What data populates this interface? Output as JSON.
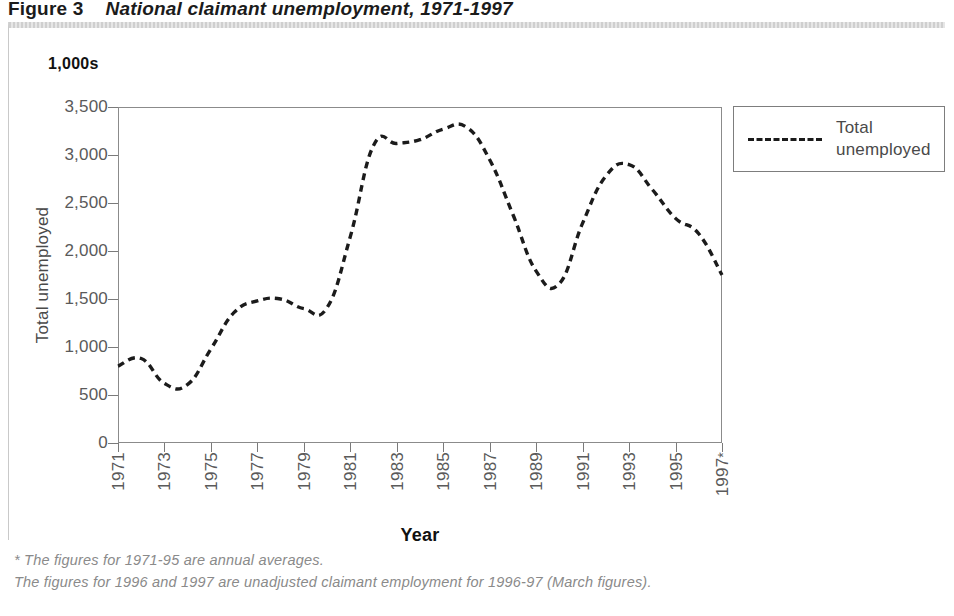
{
  "title": {
    "figure_number": "Figure 3",
    "text": "National claimant unemployment, 1971-1997"
  },
  "legend": {
    "entries": [
      {
        "label": "Total unemployed",
        "style": "dashed",
        "color": "#1b1b1b"
      }
    ]
  },
  "footnotes": [
    "* The figures for 1971-95 are annual averages.",
    "The figures for 1996 and 1997 are unadjusted claimant employment for 1996-97 (March figures)."
  ],
  "chart_data": {
    "type": "line",
    "title": "National claimant unemployment, 1971-1997",
    "unit_label": "1,000s",
    "xlabel": "Year",
    "ylabel": "Total unemployed",
    "xlim": [
      1971,
      1997
    ],
    "ylim": [
      0,
      3500
    ],
    "ytick_step": 500,
    "grid": false,
    "legend_position": "right",
    "ytick_labels": [
      "3,500",
      "3,000",
      "2,500",
      "2,000",
      "1,500",
      "1,000",
      "500",
      "0"
    ],
    "ytick_values": [
      3500,
      3000,
      2500,
      2000,
      1500,
      1000,
      500,
      0
    ],
    "xtick_labels": [
      "1971",
      "1973",
      "1975",
      "1977",
      "1979",
      "1981",
      "1983",
      "1985",
      "1987",
      "1989",
      "1991",
      "1993",
      "1995",
      "1997*"
    ],
    "xtick_values": [
      1971,
      1973,
      1975,
      1977,
      1979,
      1981,
      1983,
      1985,
      1987,
      1989,
      1991,
      1993,
      1995,
      1997
    ],
    "x": [
      1971,
      1972,
      1973,
      1974,
      1975,
      1976,
      1977,
      1978,
      1979,
      1980,
      1981,
      1982,
      1983,
      1984,
      1985,
      1986,
      1987,
      1988,
      1989,
      1990,
      1991,
      1992,
      1993,
      1994,
      1995,
      1996,
      1997
    ],
    "series": [
      {
        "name": "Total unemployed",
        "style": "dashed",
        "color": "#1b1b1b",
        "values": [
          800,
          880,
          620,
          610,
          980,
          1360,
          1480,
          1500,
          1400,
          1410,
          2150,
          3100,
          3120,
          3160,
          3270,
          3290,
          2950,
          2380,
          1790,
          1660,
          2290,
          2780,
          2900,
          2640,
          2340,
          2180,
          1750
        ]
      }
    ]
  }
}
